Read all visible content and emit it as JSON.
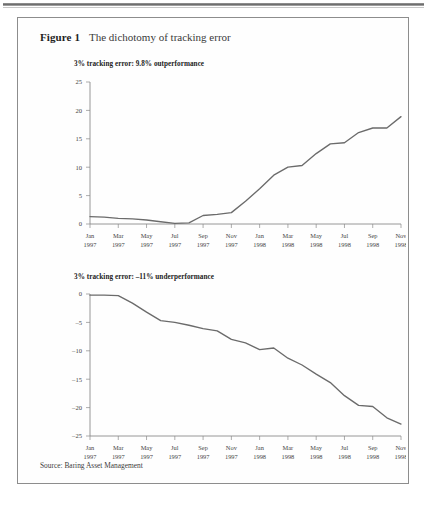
{
  "page": {
    "running_head": "",
    "source_note": "Source: Baring Asset Management"
  },
  "figure": {
    "label": "Figure 1",
    "title": "The dichotomy of tracking error"
  },
  "chart_data": [
    {
      "type": "line",
      "id": "outperformance",
      "title": "3% tracking error: 9.8% outperformance",
      "xlabel": "",
      "ylabel": "",
      "ylim": [
        0,
        25
      ],
      "yticks": [
        0,
        5,
        10,
        15,
        20,
        25
      ],
      "ytick_labels": [
        "0",
        "5",
        "10",
        "15",
        "20",
        "25"
      ],
      "grid": false,
      "legend": "none",
      "categories": [
        "Jan 1997",
        "Mar 1997",
        "May 1997",
        "Jul 1997",
        "Sep 1997",
        "Nov 1997",
        "Jan 1998",
        "Mar 1998",
        "May 1998",
        "Jul 1998",
        "Sep 1998",
        "Nov 1998"
      ],
      "xtick_labels": [
        [
          "Jan",
          "1997"
        ],
        [
          "Mar",
          "1997"
        ],
        [
          "May",
          "1997"
        ],
        [
          "Jul",
          "1997"
        ],
        [
          "Sep",
          "1997"
        ],
        [
          "Nov",
          "1997"
        ],
        [
          "Jan",
          "1998"
        ],
        [
          "Mar",
          "1998"
        ],
        [
          "May",
          "1998"
        ],
        [
          "Jul",
          "1998"
        ],
        [
          "Sep",
          "1998"
        ],
        [
          "Nov",
          "1998"
        ]
      ],
      "x": [
        0,
        1,
        2,
        3,
        4,
        5,
        6,
        7,
        8,
        9,
        10,
        11,
        12,
        13,
        14,
        15,
        16,
        17,
        18,
        19,
        20,
        21,
        22
      ],
      "values": [
        1.3,
        1.2,
        1.0,
        0.9,
        0.7,
        0.4,
        0.1,
        0.2,
        1.5,
        1.7,
        2.0,
        4.0,
        6.2,
        8.6,
        10.0,
        10.3,
        12.4,
        14.1,
        14.3,
        16.1,
        16.9,
        16.9,
        18.9
      ],
      "line_color": "#6b6b6b"
    },
    {
      "type": "line",
      "id": "underperformance",
      "title": "3% tracking error: –11% underperformance",
      "xlabel": "",
      "ylabel": "",
      "ylim": [
        -25,
        0
      ],
      "yticks": [
        0,
        -5,
        -10,
        -15,
        -20,
        -25
      ],
      "ytick_labels": [
        "0",
        "–5",
        "–10",
        "–15",
        "–20",
        "–25"
      ],
      "grid": false,
      "legend": "none",
      "categories": [
        "Jan 1997",
        "Mar 1997",
        "May 1997",
        "Jul 1997",
        "Sep 1997",
        "Nov 1997",
        "Jan 1998",
        "Mar 1998",
        "May 1998",
        "Jul 1998",
        "Sep 1998",
        "Nov 1998"
      ],
      "xtick_labels": [
        [
          "Jan",
          "1997"
        ],
        [
          "Mar",
          "1997"
        ],
        [
          "May",
          "1997"
        ],
        [
          "Jul",
          "1997"
        ],
        [
          "Sep",
          "1997"
        ],
        [
          "Nov",
          "1997"
        ],
        [
          "Jan",
          "1998"
        ],
        [
          "Mar",
          "1998"
        ],
        [
          "May",
          "1998"
        ],
        [
          "Jul",
          "1998"
        ],
        [
          "Sep",
          "1998"
        ],
        [
          "Nov",
          "1998"
        ]
      ],
      "x": [
        0,
        1,
        2,
        3,
        4,
        5,
        6,
        7,
        8,
        9,
        10,
        11,
        12,
        13,
        14,
        15,
        16,
        17,
        18,
        19,
        20,
        21,
        22
      ],
      "values": [
        -0.2,
        -0.2,
        -0.3,
        -1.6,
        -3.2,
        -4.7,
        -5.0,
        -5.5,
        -6.1,
        -6.5,
        -8.0,
        -8.6,
        -9.8,
        -9.5,
        -11.3,
        -12.5,
        -14.1,
        -15.6,
        -17.9,
        -19.6,
        -19.8,
        -21.8,
        -22.9
      ],
      "line_color": "#6b6b6b"
    }
  ]
}
